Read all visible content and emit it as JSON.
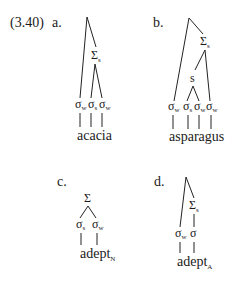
{
  "example_number": "(3.40)",
  "trees": [
    {
      "label": "a.",
      "word": "acacia",
      "word_subscript": "",
      "foot_node": {
        "symbol": "Σ",
        "subscript": "s"
      },
      "syllables": [
        {
          "symbol": "σ",
          "subscript": "w"
        },
        {
          "symbol": "σ",
          "subscript": "s"
        },
        {
          "symbol": "σ",
          "subscript": "w"
        }
      ]
    },
    {
      "label": "b.",
      "word": "asparagus",
      "word_subscript": "",
      "foot_node": {
        "symbol": "Σ",
        "subscript": "s"
      },
      "inner_node": {
        "symbol": "s",
        "subscript": ""
      },
      "syllables": [
        {
          "symbol": "σ",
          "subscript": "w"
        },
        {
          "symbol": "σ",
          "subscript": "s"
        },
        {
          "symbol": "σ",
          "subscript": "w"
        },
        {
          "symbol": "σ",
          "subscript": "w"
        }
      ]
    },
    {
      "label": "c.",
      "word": "adept",
      "word_subscript": "N",
      "foot_node": {
        "symbol": "Σ",
        "subscript": ""
      },
      "syllables": [
        {
          "symbol": "σ",
          "subscript": "s"
        },
        {
          "symbol": "σ",
          "subscript": "w"
        }
      ]
    },
    {
      "label": "d.",
      "word": "adept",
      "word_subscript": "A",
      "foot_node": {
        "symbol": "Σ",
        "subscript": "s"
      },
      "syllables": [
        {
          "symbol": "σ",
          "subscript": "w"
        },
        {
          "symbol": "σ",
          "subscript": ""
        }
      ]
    }
  ]
}
